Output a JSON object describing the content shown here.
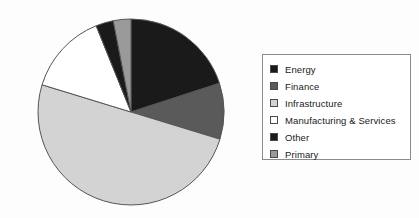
{
  "chart_data": {
    "type": "pie",
    "title": "",
    "categories": [
      "Energy",
      "Finance",
      "Infrastructure",
      "Manufacturing & Services",
      "Other",
      "Primary"
    ],
    "values": [
      20.0,
      9.7,
      50.0,
      14.2,
      3.1,
      3.0
    ],
    "units": "percent",
    "start_angle_deg": 0,
    "direction": "clockwise",
    "slice_order": [
      "Energy",
      "Finance",
      "Infrastructure",
      "Manufacturing & Services",
      "Other",
      "Primary"
    ],
    "slice_angles_deg": [
      72.0,
      35.0,
      180.0,
      51.0,
      11.0,
      11.0
    ],
    "colors": [
      "#1a1a1a",
      "#5a5a5a",
      "#d3d3d3",
      "#ffffff",
      "#1a1a1a",
      "#9a9a9a"
    ],
    "edge_color": "#555555",
    "grid": false,
    "legend_position": "right",
    "legend_entries": [
      {
        "label": "Energy",
        "color": "#1a1a1a"
      },
      {
        "label": "Finance",
        "color": "#5a5a5a"
      },
      {
        "label": "Infrastructure",
        "color": "#d3d3d3"
      },
      {
        "label": "Manufacturing & Services",
        "color": "#ffffff"
      },
      {
        "label": "Other",
        "color": "#1a1a1a"
      },
      {
        "label": "Primary",
        "color": "#9a9a9a"
      }
    ],
    "xlabel": "",
    "ylabel": ""
  },
  "legend": {
    "items": [
      {
        "label": "Energy"
      },
      {
        "label": "Finance"
      },
      {
        "label": "Infrastructure"
      },
      {
        "label": "Manufacturing & Services"
      },
      {
        "label": "Other"
      },
      {
        "label": "Primary"
      }
    ]
  }
}
